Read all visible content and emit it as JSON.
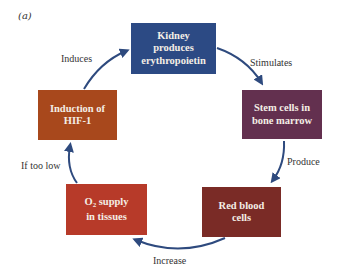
{
  "panel_label": "(a)",
  "nodes": {
    "kidney": {
      "line1": "Kidney",
      "line2": "produces",
      "line3": "erythropoietin",
      "color": "#2c4a84"
    },
    "stem": {
      "line1": "Stem cells in",
      "line2": "bone marrow",
      "color": "#63304f"
    },
    "rbc": {
      "line1": "Red blood",
      "line2": "cells",
      "color": "#7a2b26"
    },
    "o2": {
      "prefix": "O",
      "subscript": "2",
      "line1_rest": " supply",
      "line2": "in tissues",
      "color": "#b73a29"
    },
    "hif": {
      "line1": "Induction of",
      "line2": "HIF-1",
      "color": "#a8481c"
    }
  },
  "edges": {
    "induces": "Induces",
    "stimulates": "Stimulates",
    "produce": "Produce",
    "increase": "Increase",
    "if_too_low": "If too low"
  },
  "arrow_color": "#2e4a7e"
}
